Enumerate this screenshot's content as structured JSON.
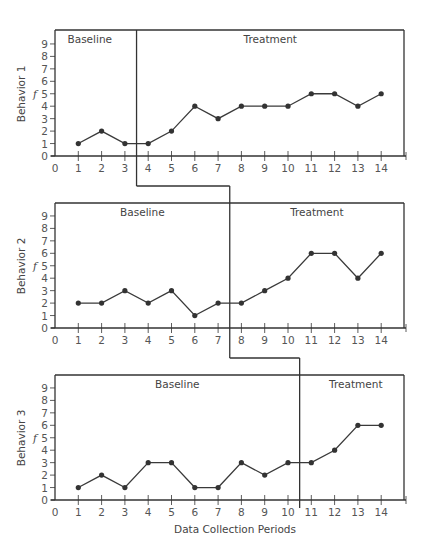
{
  "chart_data": {
    "type": "line",
    "title": "",
    "xlabel": "Data Collection Periods",
    "x": [
      1,
      2,
      3,
      4,
      5,
      6,
      7,
      8,
      9,
      10,
      11,
      12,
      13,
      14
    ],
    "x_ticks": [
      "0",
      "1",
      "2",
      "3",
      "4",
      "5",
      "6",
      "7",
      "8",
      "9",
      "10",
      "11",
      "12",
      "13",
      "14"
    ],
    "y_ticks": [
      "0",
      "1",
      "2",
      "3",
      "4",
      "5",
      "6",
      "7",
      "8",
      "9"
    ],
    "xlim": [
      0,
      15
    ],
    "ylim": [
      0,
      10
    ],
    "grid": false,
    "panels": [
      {
        "name": "Behavior 1",
        "ylabel": "Behavior 1",
        "ysub": "f",
        "baseline_label": "Baseline",
        "treatment_label": "Treatment",
        "phase_change_after": 3.5,
        "values": [
          1,
          2,
          1,
          1,
          2,
          4,
          3,
          4,
          4,
          4,
          5,
          5,
          4,
          5
        ]
      },
      {
        "name": "Behavior 2",
        "ylabel": "Behavior 2",
        "ysub": "f",
        "baseline_label": "Baseline",
        "treatment_label": "Treatment",
        "phase_change_after": 7.5,
        "values": [
          2,
          2,
          3,
          2,
          3,
          1,
          2,
          2,
          3,
          4,
          6,
          6,
          4,
          6
        ]
      },
      {
        "name": "Behavior 3",
        "ylabel": "Behavior 3",
        "ysub": "f",
        "baseline_label": "Baseline",
        "treatment_label": "Treatment",
        "phase_change_after": 10.5,
        "values": [
          1,
          2,
          1,
          3,
          3,
          1,
          1,
          3,
          2,
          3,
          3,
          4,
          6,
          6
        ]
      }
    ]
  }
}
